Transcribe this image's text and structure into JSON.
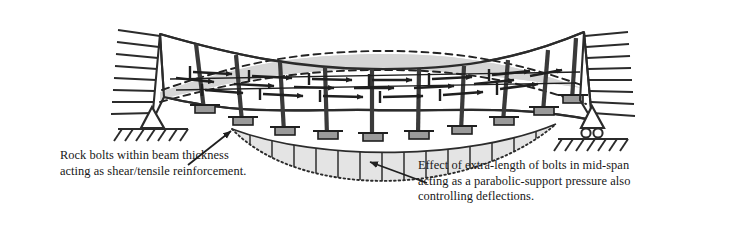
{
  "figure": {
    "kind": "engineering-diagram",
    "background_color": "#ffffff",
    "line_color": "#2b2b2b",
    "beam_fill": "#d6d6d6",
    "pressure_fill": "#e2e2e2",
    "dashed_color": "#232323"
  },
  "captions": {
    "left": {
      "name": "rock-bolts-caption",
      "lines": [
        "Rock bolts within beam thickness",
        "acting as shear/tensile reinforcement."
      ]
    },
    "right": {
      "name": "parabolic-pressure-caption",
      "lines": [
        "Effect of extra-length of bolts in mid-span",
        "acting as a parabolic-support pressure also",
        "controlling deflections."
      ]
    }
  },
  "supports": {
    "left": {
      "name": "pin-support",
      "type": "pinned",
      "x": 152,
      "y": 122
    },
    "right": {
      "name": "roller-support",
      "type": "roller",
      "x": 592,
      "y": 124
    }
  },
  "annotations": {
    "leader_left": {
      "name": "leader-line-left",
      "from": [
        186,
        163
      ],
      "to": [
        233,
        130
      ]
    },
    "leader_right": {
      "name": "leader-line-right",
      "from": [
        425,
        182
      ],
      "to": [
        368,
        160
      ]
    }
  },
  "elements": {
    "bolt_count": 10,
    "rock_bolt_rows": 3,
    "pressure_hatch_lines": 12
  }
}
